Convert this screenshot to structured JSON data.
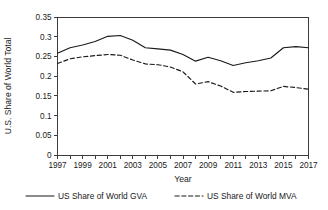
{
  "chart_data": {
    "type": "line",
    "title": "",
    "xlabel": "Year",
    "ylabel": "U.S. Share of World Total",
    "xlim": [
      1997,
      2017
    ],
    "ylim": [
      0,
      0.35
    ],
    "ytick_step": 0.05,
    "xtick_step": 1,
    "xtick_label_step": 2,
    "grid": false,
    "legend_position": "bottom",
    "x": [
      1997,
      1998,
      1999,
      2000,
      2001,
      2002,
      2003,
      2004,
      2005,
      2006,
      2007,
      2008,
      2009,
      2010,
      2011,
      2012,
      2013,
      2014,
      2015,
      2016,
      2017
    ],
    "xtick_labels": [
      "1997",
      "",
      "1999",
      "",
      "2001",
      "",
      "2003",
      "",
      "2005",
      "",
      "2007",
      "",
      "2009",
      "",
      "2011",
      "",
      "2013",
      "",
      "2015",
      "",
      "2017"
    ],
    "ytick_labels": [
      "0",
      "0.05",
      "0.1",
      "0.15",
      "0.2",
      "0.25",
      "0.3",
      "0.35"
    ],
    "ytick_values": [
      0,
      0.05,
      0.1,
      0.15,
      0.2,
      0.25,
      0.3,
      0.35
    ],
    "series": [
      {
        "name": "US Share of World GVA",
        "style": "solid",
        "color": "#1a1a1a",
        "values": [
          0.258,
          0.272,
          0.279,
          0.288,
          0.301,
          0.303,
          0.291,
          0.272,
          0.269,
          0.266,
          0.255,
          0.238,
          0.248,
          0.239,
          0.227,
          0.234,
          0.239,
          0.246,
          0.272,
          0.275,
          0.272
        ]
      },
      {
        "name": "US Share of World MVA",
        "style": "dashed",
        "color": "#1a1a1a",
        "values": [
          0.232,
          0.244,
          0.249,
          0.252,
          0.255,
          0.253,
          0.241,
          0.231,
          0.229,
          0.223,
          0.211,
          0.18,
          0.186,
          0.175,
          0.159,
          0.161,
          0.162,
          0.163,
          0.174,
          0.171,
          0.167
        ]
      }
    ]
  },
  "legend": {
    "items": [
      {
        "label": "US Share of World GVA",
        "style": "solid"
      },
      {
        "label": "US Share of World MVA",
        "style": "dashed"
      }
    ]
  }
}
